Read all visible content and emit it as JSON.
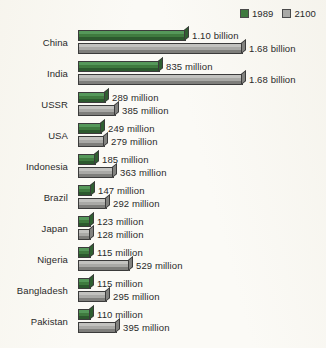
{
  "legend": {
    "position": "top-right",
    "items": [
      {
        "label": "1989",
        "color": "#3f7a3f",
        "swatch_name": "legend-swatch-1989"
      },
      {
        "label": "2100",
        "color": "#a9a9a6",
        "swatch_name": "legend-swatch-2100"
      }
    ]
  },
  "chart_data": {
    "type": "bar",
    "orientation": "horizontal",
    "title": "",
    "subtitle": "",
    "xlabel": "",
    "ylabel": "",
    "grid": false,
    "legend_position": "top-right",
    "axis_visible": false,
    "unit": "people",
    "xlim": [
      0,
      1.8
    ],
    "value_unit_note": "values in billions; labels shown as written on chart",
    "categories": [
      "China",
      "India",
      "USSR",
      "USA",
      "Indonesia",
      "Brazil",
      "Japan",
      "Nigeria",
      "Bangladesh",
      "Pakistan"
    ],
    "series": [
      {
        "name": "1989",
        "color": "#3f7a3f",
        "values": [
          1.1,
          0.835,
          0.289,
          0.249,
          0.185,
          0.147,
          0.123,
          0.115,
          0.115,
          0.11
        ],
        "labels": [
          "1.10 billion",
          "835 million",
          "289 million",
          "249 million",
          "185 million",
          "147 million",
          "123 million",
          "115 million",
          "115 million",
          "110 million"
        ]
      },
      {
        "name": "2100",
        "color": "#a9a9a6",
        "values": [
          1.68,
          1.68,
          0.385,
          0.279,
          0.363,
          0.292,
          0.128,
          0.529,
          0.295,
          0.395
        ],
        "labels": [
          "1.68 billion",
          "1.68 billion",
          "385 million",
          "279 million",
          "363 million",
          "292 million",
          "128 million",
          "529 million",
          "295 million",
          "395 million"
        ]
      }
    ]
  }
}
